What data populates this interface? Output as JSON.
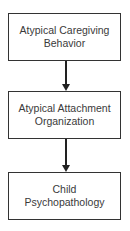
{
  "diagram": {
    "type": "flowchart",
    "direction": "top-to-bottom",
    "nodes": [
      {
        "id": "n1",
        "label_line1": "Atypical Caregiving",
        "label_line2": "Behavior"
      },
      {
        "id": "n2",
        "label_line1": "Atypical Attachment",
        "label_line2": "Organization"
      },
      {
        "id": "n3",
        "label_line1": "Child",
        "label_line2": "Psychopathology"
      }
    ],
    "edges": [
      {
        "from": "n1",
        "to": "n2"
      },
      {
        "from": "n2",
        "to": "n3"
      }
    ]
  }
}
